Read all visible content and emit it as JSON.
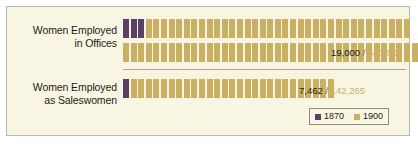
{
  "panel": {
    "background_color": "#f8f6e3",
    "border_color": "#b9b9b3"
  },
  "colors": {
    "series_1870": "#5b3f64",
    "series_1900": "#c9b063",
    "text": "#1b1b1b",
    "divider": "#a9a793"
  },
  "groups": [
    {
      "id": "offices",
      "label_line1": "Women Employed",
      "label_line2": "in Offices",
      "value_old": "19,000",
      "value_separator": "/",
      "value_new": "503,000"
    },
    {
      "id": "sales",
      "label_line1": "Women Employed",
      "label_line2": "as Saleswomen",
      "value_old": "7,462",
      "value_separator": "/",
      "value_new": "142,265"
    }
  ],
  "legend": {
    "items": [
      {
        "label": "1870",
        "color": "#5b3f64"
      },
      {
        "label": "1900",
        "color": "#c9b063"
      }
    ]
  },
  "chart_data": {
    "type": "pictogram",
    "title": "",
    "xlabel": "",
    "ylabel": "",
    "unit_note": "each figure icon represents a fixed number of women",
    "categories": [
      "Women Employed in Offices",
      "Women Employed as Saleswomen"
    ],
    "series": [
      {
        "name": "1870",
        "color": "#5b3f64",
        "values": [
          19000,
          7462
        ],
        "icon_counts": [
          3,
          1
        ]
      },
      {
        "name": "1900",
        "color": "#c9b063",
        "values": [
          503000,
          142265
        ],
        "icon_counts": [
          74,
          27
        ]
      }
    ],
    "rows": [
      {
        "category": "Women Employed in Offices",
        "label_value_old": "19,000",
        "label_value_new": "503,000",
        "icon_rows": [
          {
            "icons_1870": 3,
            "icons_1900": 35
          },
          {
            "icons_1870": 0,
            "icons_1900": 39
          }
        ]
      },
      {
        "category": "Women Employed as Saleswomen",
        "label_value_old": "7,462",
        "label_value_new": "142,265",
        "icon_rows": [
          {
            "icons_1870": 1,
            "icons_1900": 27
          }
        ]
      }
    ],
    "legend_position": "bottom-right",
    "grid": false
  }
}
